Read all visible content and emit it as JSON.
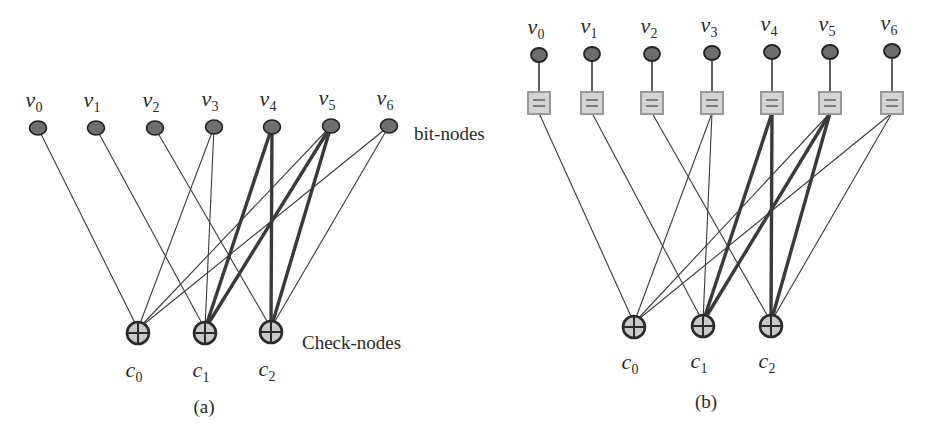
{
  "figure": {
    "panels": [
      {
        "id": "a",
        "caption": "(a)",
        "bit_nodes_label": "bit-nodes",
        "check_nodes_label": "Check-nodes",
        "bit_nodes": [
          {
            "name": "v",
            "sub": "0",
            "x": 38,
            "y": 128
          },
          {
            "name": "v",
            "sub": "1",
            "x": 96,
            "y": 128
          },
          {
            "name": "v",
            "sub": "2",
            "x": 155,
            "y": 128
          },
          {
            "name": "v",
            "sub": "3",
            "x": 214,
            "y": 127
          },
          {
            "name": "v",
            "sub": "4",
            "x": 272,
            "y": 127
          },
          {
            "name": "v",
            "sub": "5",
            "x": 331,
            "y": 126
          },
          {
            "name": "v",
            "sub": "6",
            "x": 389,
            "y": 126
          }
        ],
        "check_nodes": [
          {
            "name": "c",
            "sub": "0",
            "x": 138,
            "y": 333
          },
          {
            "name": "c",
            "sub": "1",
            "x": 205,
            "y": 333
          },
          {
            "name": "c",
            "sub": "2",
            "x": 271,
            "y": 332
          }
        ]
      },
      {
        "id": "b",
        "caption": "(b)",
        "bit_nodes": [
          {
            "name": "v",
            "sub": "0",
            "x": 539,
            "y": 55
          },
          {
            "name": "v",
            "sub": "1",
            "x": 592,
            "y": 54
          },
          {
            "name": "v",
            "sub": "2",
            "x": 652,
            "y": 54
          },
          {
            "name": "v",
            "sub": "3",
            "x": 712,
            "y": 53
          },
          {
            "name": "v",
            "sub": "4",
            "x": 772,
            "y": 52
          },
          {
            "name": "v",
            "sub": "5",
            "x": 830,
            "y": 52
          },
          {
            "name": "v",
            "sub": "6",
            "x": 892,
            "y": 51
          }
        ],
        "equality_symbol": "=",
        "check_nodes": [
          {
            "name": "c",
            "sub": "0",
            "x": 634,
            "y": 327
          },
          {
            "name": "c",
            "sub": "1",
            "x": 703,
            "y": 326
          },
          {
            "name": "c",
            "sub": "2",
            "x": 771,
            "y": 326
          }
        ]
      }
    ],
    "edges": [
      {
        "check": 0,
        "bit": 0,
        "thick": false
      },
      {
        "check": 0,
        "bit": 3,
        "thick": false
      },
      {
        "check": 0,
        "bit": 5,
        "thick": false
      },
      {
        "check": 0,
        "bit": 6,
        "thick": false
      },
      {
        "check": 1,
        "bit": 1,
        "thick": false
      },
      {
        "check": 1,
        "bit": 3,
        "thick": false
      },
      {
        "check": 1,
        "bit": 4,
        "thick": true
      },
      {
        "check": 1,
        "bit": 5,
        "thick": true
      },
      {
        "check": 2,
        "bit": 2,
        "thick": false
      },
      {
        "check": 2,
        "bit": 4,
        "thick": true
      },
      {
        "check": 2,
        "bit": 5,
        "thick": true
      },
      {
        "check": 2,
        "bit": 6,
        "thick": false
      }
    ],
    "colors": {
      "line": "#3a3a3a",
      "bit_node_fill": "#6e6e6e",
      "bit_node_stroke": "#222222",
      "check_node_fill": "#c8c8c8",
      "check_node_stroke": "#2a2a2a",
      "eq_box_fill": "#d4d4d4",
      "eq_box_stroke": "#9a9a9a"
    }
  }
}
